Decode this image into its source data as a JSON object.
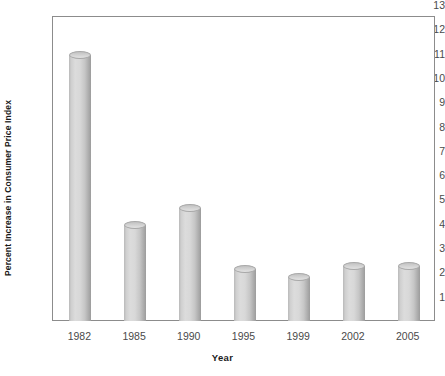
{
  "chart_data": {
    "type": "bar",
    "title": "",
    "subtitle": "",
    "xlabel": "Year",
    "ylabel": "Percent Increase in Consumer Price Index",
    "categories": [
      "1982",
      "1985",
      "1990",
      "1995",
      "1999",
      "2002",
      "2005"
    ],
    "values": [
      11.0,
      4.0,
      4.7,
      2.2,
      1.85,
      2.3,
      2.3
    ],
    "series": [
      {
        "name": "Percent Increase in Consumer Price Index",
        "values": [
          11.0,
          4.0,
          4.7,
          2.2,
          1.85,
          2.3,
          2.3
        ]
      }
    ],
    "ylim": [
      0,
      13
    ],
    "xlim_categories": 7,
    "y_ticks": [
      1,
      2,
      3,
      4,
      5,
      6,
      7,
      8,
      9,
      10,
      11,
      12,
      13
    ],
    "y_tick_labels": [
      "1",
      "2",
      "3",
      "4",
      "5",
      "6",
      "7",
      "8",
      "9",
      "10",
      "11",
      "12",
      "13"
    ],
    "grid": false,
    "legend": null,
    "legend_position": "none",
    "bar_style": "3d-cylinder",
    "colors": {
      "bar_fill_light": "#dcdcdc",
      "bar_fill_dark": "#9c9c9c",
      "bar_outline": "#a8a8a8",
      "frame": "#8c8c8c",
      "tick_text": "#4a4a4a",
      "axis_title_text": "#1a1a1a",
      "background": "#ffffff"
    },
    "annotations": []
  },
  "axes": {
    "y_title": "Percent Increase in Consumer Price Index",
    "x_title": "Year"
  }
}
